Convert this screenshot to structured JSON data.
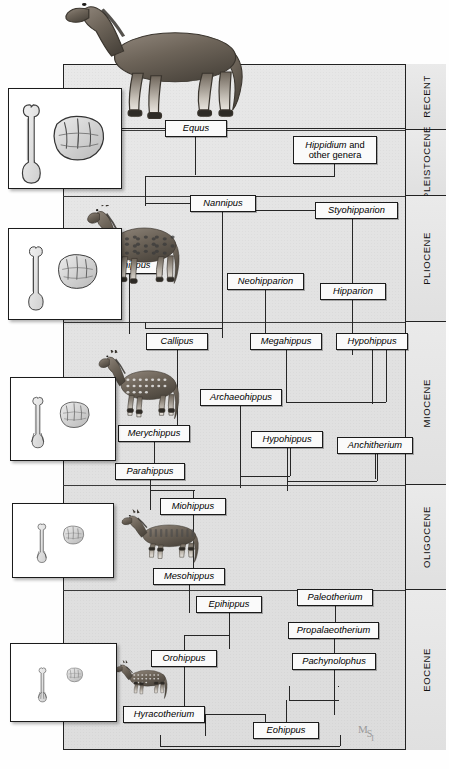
{
  "figure": {
    "watermark": {
      "m": "M",
      "s": "S",
      "i": "I"
    }
  },
  "epochs": [
    {
      "name": "RECENT",
      "top": 64,
      "height": 66
    },
    {
      "name": "PLEISTOCENE",
      "top": 130,
      "height": 66
    },
    {
      "name": "PLIOCENE",
      "top": 196,
      "height": 126
    },
    {
      "name": "MIOCENE",
      "top": 322,
      "height": 163
    },
    {
      "name": "OLIGOCENE",
      "top": 485,
      "height": 105
    },
    {
      "name": "EOCENE",
      "top": 590,
      "height": 160
    }
  ],
  "taxa": [
    {
      "id": "equus",
      "label": "Equus",
      "epoch": "PLEISTOCENE",
      "left": 165,
      "top": 120,
      "width": 62,
      "height": 17
    },
    {
      "id": "hippidium",
      "label": "Hippidium and other genera",
      "label_lead": "Hippidium",
      "label_rest": " and other genera",
      "epoch": "PLEISTOCENE",
      "left": 293,
      "top": 136,
      "width": 84,
      "height": 28,
      "two_line": true
    },
    {
      "id": "nannipus",
      "label": "Nannipus",
      "epoch": "PLIOCENE",
      "left": 190,
      "top": 195,
      "width": 66,
      "height": 17
    },
    {
      "id": "styohipparion",
      "label": "Styohipparion",
      "epoch": "PLIOCENE",
      "left": 315,
      "top": 202,
      "width": 83,
      "height": 17
    },
    {
      "id": "pliohippus",
      "label": "Pliohippus",
      "epoch": "PLIOCENE",
      "left": 96,
      "top": 257,
      "width": 66,
      "height": 17
    },
    {
      "id": "neohipparion",
      "label": "Neohipparion",
      "epoch": "PLIOCENE",
      "left": 227,
      "top": 273,
      "width": 77,
      "height": 17
    },
    {
      "id": "hipparion",
      "label": "Hipparion",
      "epoch": "PLIOCENE",
      "left": 320,
      "top": 283,
      "width": 66,
      "height": 17
    },
    {
      "id": "callipus",
      "label": "Callipus",
      "epoch": "MIOCENE",
      "left": 146,
      "top": 333,
      "width": 62,
      "height": 17
    },
    {
      "id": "megahippus",
      "label": "Megahippus",
      "epoch": "MIOCENE",
      "left": 250,
      "top": 333,
      "width": 72,
      "height": 17
    },
    {
      "id": "hypohippus_top",
      "label": "Hypohippus",
      "epoch": "MIOCENE",
      "left": 336,
      "top": 333,
      "width": 72,
      "height": 17
    },
    {
      "id": "archaeohippus",
      "label": "Archaeohippus",
      "epoch": "MIOCENE",
      "left": 200,
      "top": 389,
      "width": 82,
      "height": 17
    },
    {
      "id": "merychippus",
      "label": "Merychippus",
      "epoch": "MIOCENE",
      "left": 118,
      "top": 425,
      "width": 72,
      "height": 17
    },
    {
      "id": "hypohippus_bot",
      "label": "Hypohippus",
      "epoch": "MIOCENE",
      "left": 251,
      "top": 431,
      "width": 72,
      "height": 17
    },
    {
      "id": "anchitherium",
      "label": "Anchitherium",
      "epoch": "MIOCENE",
      "left": 337,
      "top": 437,
      "width": 76,
      "height": 17
    },
    {
      "id": "parahippus",
      "label": "Parahippus",
      "epoch": "MIOCENE",
      "left": 115,
      "top": 463,
      "width": 70,
      "height": 17
    },
    {
      "id": "miohippus",
      "label": "Miohippus",
      "epoch": "OLIGOCENE",
      "left": 160,
      "top": 498,
      "width": 66,
      "height": 17
    },
    {
      "id": "mesohippus",
      "label": "Mesohippus",
      "epoch": "OLIGOCENE",
      "left": 153,
      "top": 568,
      "width": 72,
      "height": 17
    },
    {
      "id": "epihippus",
      "label": "Epihippus",
      "epoch": "EOCENE",
      "left": 196,
      "top": 596,
      "width": 66,
      "height": 17
    },
    {
      "id": "paleotherium",
      "label": "Paleotherium",
      "epoch": "EOCENE",
      "left": 297,
      "top": 589,
      "width": 76,
      "height": 17
    },
    {
      "id": "propalaeotherium",
      "label": "Propalaeotherium",
      "epoch": "EOCENE",
      "left": 288,
      "top": 622,
      "width": 91,
      "height": 17
    },
    {
      "id": "orohippus",
      "label": "Orohippus",
      "epoch": "EOCENE",
      "left": 151,
      "top": 650,
      "width": 66,
      "height": 17
    },
    {
      "id": "pachynolophus",
      "label": "Pachynolophus",
      "epoch": "EOCENE",
      "left": 292,
      "top": 653,
      "width": 84,
      "height": 17
    },
    {
      "id": "hyracotherium",
      "label": "Hyracotherium",
      "epoch": "EOCENE",
      "left": 123,
      "top": 706,
      "width": 82,
      "height": 17
    },
    {
      "id": "eohippus",
      "label": "Eohippus",
      "epoch": "EOCENE",
      "left": 253,
      "top": 722,
      "width": 66,
      "height": 17
    }
  ],
  "fossil_panels": [
    {
      "id": "fossil-equus",
      "caption": "limb bone and molar tooth of Equus",
      "left": 8,
      "top": 88,
      "width": 112,
      "height": 99
    },
    {
      "id": "fossil-pliohippus",
      "caption": "limb bone and molar tooth of Pliohippus",
      "left": 8,
      "top": 228,
      "width": 112,
      "height": 90
    },
    {
      "id": "fossil-merychippus",
      "caption": "limb bone and molar tooth of Merychippus",
      "left": 10,
      "top": 377,
      "width": 104,
      "height": 82
    },
    {
      "id": "fossil-mesohippus",
      "caption": "limb bone and molar tooth of Mesohippus",
      "left": 12,
      "top": 503,
      "width": 100,
      "height": 73
    },
    {
      "id": "fossil-hyracotherium",
      "caption": "limb bone and molar tooth of Hyracotherium",
      "left": 10,
      "top": 643,
      "width": 105,
      "height": 77
    }
  ],
  "horse_figures": [
    {
      "id": "horse-equus",
      "name": "Equus",
      "left": 57,
      "top": 2,
      "width": 212,
      "height": 135
    },
    {
      "id": "horse-pliohippus",
      "name": "Pliohippus",
      "left": 83,
      "top": 205,
      "width": 110,
      "height": 98
    },
    {
      "id": "horse-merychippus",
      "name": "Merychippus",
      "left": 95,
      "top": 350,
      "width": 96,
      "height": 86
    },
    {
      "id": "horse-mesohippus",
      "name": "Mesohippus",
      "left": 118,
      "top": 508,
      "width": 92,
      "height": 68
    },
    {
      "id": "horse-hyracotherium",
      "name": "Hyracotherium",
      "left": 113,
      "top": 657,
      "width": 62,
      "height": 52
    }
  ],
  "connectors": [
    {
      "id": "c-equus-stem",
      "type": "v",
      "left": 195,
      "top": 137,
      "length": 38
    },
    {
      "id": "c-equus-left",
      "type": "h",
      "left": 65,
      "top": 128,
      "length": 100
    },
    {
      "id": "c-equus-right",
      "type": "h",
      "left": 227,
      "top": 128,
      "length": 178
    },
    {
      "id": "c-hippidium-stem",
      "type": "v",
      "left": 334,
      "top": 164,
      "length": 12
    },
    {
      "id": "c-junction-h",
      "type": "h",
      "left": 145,
      "top": 176,
      "length": 190
    },
    {
      "id": "c-junction-left-v",
      "type": "v",
      "left": 145,
      "top": 176,
      "length": 30
    },
    {
      "id": "c-nannipus-in",
      "type": "h",
      "left": 145,
      "top": 203,
      "length": 45
    },
    {
      "id": "c-nannipus-out",
      "type": "h",
      "left": 256,
      "top": 210,
      "length": 59
    },
    {
      "id": "c-nannipus-stem",
      "type": "v",
      "left": 222,
      "top": 212,
      "length": 116
    },
    {
      "id": "c-styo-stem",
      "type": "v",
      "left": 352,
      "top": 219,
      "length": 64
    },
    {
      "id": "c-hipparion-stem",
      "type": "v",
      "left": 352,
      "top": 300,
      "length": 55
    },
    {
      "id": "c-pliohippus-stem",
      "type": "v",
      "left": 129,
      "top": 274,
      "length": 60
    },
    {
      "id": "c-neohipparion-stem",
      "type": "v",
      "left": 265,
      "top": 290,
      "length": 54
    },
    {
      "id": "c-callipus-stem",
      "type": "v",
      "left": 177,
      "top": 350,
      "length": 80
    },
    {
      "id": "c-mega-stem",
      "type": "v",
      "left": 286,
      "top": 350,
      "length": 52
    },
    {
      "id": "c-hypo-top-stem",
      "type": "v",
      "left": 372,
      "top": 350,
      "length": 54
    },
    {
      "id": "c-archaeo-stem",
      "type": "v",
      "left": 240,
      "top": 406,
      "length": 70
    },
    {
      "id": "c-mery-stem",
      "type": "v",
      "left": 154,
      "top": 442,
      "length": 21
    },
    {
      "id": "c-hypo-bot-stem",
      "type": "v",
      "left": 287,
      "top": 448,
      "length": 33
    },
    {
      "id": "c-anchi-stem",
      "type": "v",
      "left": 375,
      "top": 454,
      "length": 25
    },
    {
      "id": "c-para-stem",
      "type": "v",
      "left": 150,
      "top": 480,
      "length": 18
    },
    {
      "id": "c-mio-stem",
      "type": "v",
      "left": 193,
      "top": 515,
      "length": 53
    },
    {
      "id": "c-meso-stem",
      "type": "v",
      "left": 189,
      "top": 585,
      "length": 28
    },
    {
      "id": "c-epi-stem",
      "type": "v",
      "left": 229,
      "top": 613,
      "length": 22
    },
    {
      "id": "c-oro-stem",
      "type": "v",
      "left": 184,
      "top": 667,
      "length": 39
    },
    {
      "id": "c-paleo-stem",
      "type": "v",
      "left": 335,
      "top": 606,
      "length": 16
    },
    {
      "id": "c-propal-stem",
      "type": "v",
      "left": 334,
      "top": 639,
      "length": 14
    },
    {
      "id": "c-pachy-stem",
      "type": "v",
      "left": 334,
      "top": 670,
      "length": 45
    },
    {
      "id": "c-eohippus-stem",
      "type": "v",
      "left": 286,
      "top": 700,
      "length": 22
    },
    {
      "id": "c-base-h",
      "type": "h",
      "left": 160,
      "top": 746,
      "length": 180
    }
  ],
  "colors": {
    "chart_background": "#e4e4e4",
    "box_fill": "#fafafa",
    "line": "#262626",
    "border": "#1b1b1b",
    "epoch_band": "#e6e6e6"
  }
}
